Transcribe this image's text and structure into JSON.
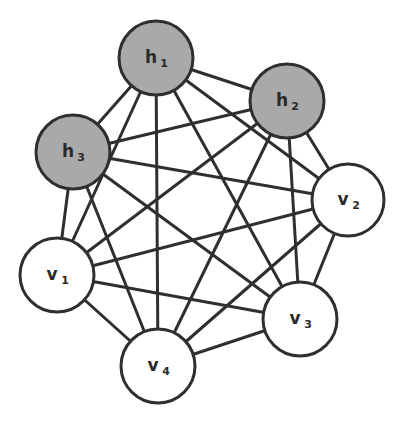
{
  "diagram": {
    "type": "undirected-graph",
    "colors": {
      "edge": "#2f2f2f",
      "hidden_fill": "#a9a9a9",
      "visible_fill": "#ffffff",
      "outline": "#2f2f2f"
    },
    "nodes": [
      {
        "id": "h1",
        "base": "h",
        "sub": "1",
        "kind": "hidden",
        "x": 156,
        "y": 58,
        "r": 37
      },
      {
        "id": "h2",
        "base": "h",
        "sub": "2",
        "kind": "hidden",
        "x": 287,
        "y": 101,
        "r": 37
      },
      {
        "id": "h3",
        "base": "h",
        "sub": "3",
        "kind": "hidden",
        "x": 73,
        "y": 152,
        "r": 37
      },
      {
        "id": "v2",
        "base": "v",
        "sub": "2",
        "kind": "visible",
        "x": 348,
        "y": 200,
        "r": 36
      },
      {
        "id": "v1",
        "base": "v",
        "sub": "1",
        "kind": "visible",
        "x": 57,
        "y": 275,
        "r": 37
      },
      {
        "id": "v3",
        "base": "v",
        "sub": "3",
        "kind": "visible",
        "x": 300,
        "y": 319,
        "r": 37
      },
      {
        "id": "v4",
        "base": "v",
        "sub": "4",
        "kind": "visible",
        "x": 158,
        "y": 366,
        "r": 37
      }
    ],
    "edges": [
      [
        "h1",
        "h2"
      ],
      [
        "h1",
        "h3"
      ],
      [
        "h1",
        "v1"
      ],
      [
        "h1",
        "v2"
      ],
      [
        "h1",
        "v3"
      ],
      [
        "h1",
        "v4"
      ],
      [
        "h2",
        "h3"
      ],
      [
        "h2",
        "v1"
      ],
      [
        "h2",
        "v2"
      ],
      [
        "h2",
        "v3"
      ],
      [
        "h2",
        "v4"
      ],
      [
        "h3",
        "v1"
      ],
      [
        "h3",
        "v2"
      ],
      [
        "h3",
        "v3"
      ],
      [
        "h3",
        "v4"
      ],
      [
        "v1",
        "v2"
      ],
      [
        "v1",
        "v3"
      ],
      [
        "v1",
        "v4"
      ],
      [
        "v2",
        "v3"
      ],
      [
        "v2",
        "v4"
      ],
      [
        "v3",
        "v4"
      ]
    ]
  }
}
